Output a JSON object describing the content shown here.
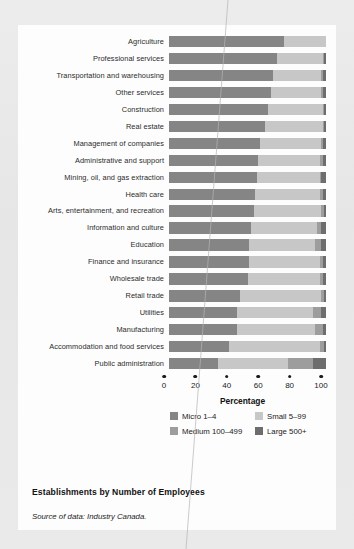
{
  "figure": {
    "title": "Establishments by Number of Employees",
    "source_label": "Source of data:",
    "source_value": "Industry Canada."
  },
  "chart_data": {
    "type": "bar",
    "orientation": "horizontal",
    "stacked": true,
    "normalized": true,
    "title": "Establishments by Number of Employees",
    "xlabel": "Percentage",
    "ylabel": "",
    "xlim": [
      0,
      100
    ],
    "xticks": [
      0,
      20,
      40,
      60,
      80,
      100
    ],
    "xticklabels": [
      "0",
      "20",
      "40",
      "60",
      "80",
      "100"
    ],
    "grid": false,
    "legend_position": "below-axis",
    "categories": [
      "Agriculture",
      "Professional services",
      "Transportation and warehousing",
      "Other services",
      "Construction",
      "Real estate",
      "Management of companies",
      "Administrative and support",
      "Mining, oil, and gas extraction",
      "Health care",
      "Arts, entertainment, and recreation",
      "Information and culture",
      "Education",
      "Finance and insurance",
      "Wholesale trade",
      "Retail trade",
      "Utilities",
      "Manufacturing",
      "Accommodation and food services",
      "Public administration"
    ],
    "series": [
      {
        "name": "Micro 1–4",
        "color": "#858585",
        "values": [
          73,
          69,
          66,
          65,
          63,
          61,
          58,
          57,
          56,
          55,
          54,
          52,
          51,
          51,
          50,
          45,
          43,
          43,
          38,
          31
        ]
      },
      {
        "name": "Small 5–99",
        "color": "#c7c7c7",
        "values": [
          27,
          29,
          31,
          32,
          35,
          37,
          39,
          39,
          40,
          41,
          43,
          42,
          42,
          45,
          46,
          52,
          49,
          50,
          58,
          45
        ]
      },
      {
        "name": "Medium 100–499",
        "color": "#9d9d9d",
        "values": [
          0,
          1,
          1,
          1,
          1,
          1,
          1,
          2,
          1,
          2,
          2,
          3,
          4,
          2,
          2,
          2,
          5,
          5,
          3,
          16
        ]
      },
      {
        "name": "Large 500+",
        "color": "#6d6d6d",
        "values": [
          0,
          1,
          2,
          2,
          1,
          1,
          2,
          2,
          3,
          2,
          1,
          3,
          3,
          2,
          2,
          1,
          3,
          2,
          1,
          8
        ]
      }
    ]
  },
  "legend": {
    "items": [
      {
        "label": "Micro 1–4",
        "color": "#858585",
        "swatch": "micro"
      },
      {
        "label": "Small 5–99",
        "color": "#c7c7c7",
        "swatch": "small"
      },
      {
        "label": "Medium 100–499",
        "color": "#9d9d9d",
        "swatch": "medium"
      },
      {
        "label": "Large 500+",
        "color": "#6d6d6d",
        "swatch": "large"
      }
    ]
  },
  "colors": {
    "page_background": "#e9e9e9",
    "card_background": "#fdfdfd",
    "text": "#1b1b1b",
    "micro": "#858585",
    "small": "#c7c7c7",
    "medium": "#9d9d9d",
    "large": "#6d6d6d"
  }
}
